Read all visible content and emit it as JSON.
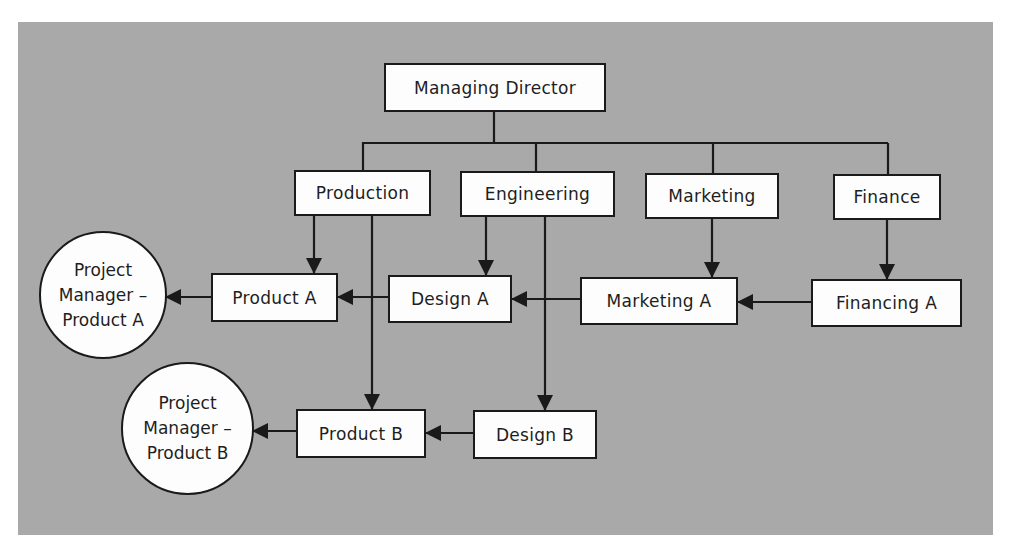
{
  "diagram": {
    "type": "matrix organization chart",
    "background_color": "#a9a9a9",
    "box_color": "#fdfdfd",
    "line_color": "#1a1a1a",
    "top": {
      "id": "md",
      "label": "Managing Director"
    },
    "departments": [
      {
        "id": "production",
        "label": "Production"
      },
      {
        "id": "engineering",
        "label": "Engineering"
      },
      {
        "id": "marketing",
        "label": "Marketing"
      },
      {
        "id": "finance",
        "label": "Finance"
      }
    ],
    "project_a_units": [
      {
        "id": "product_a",
        "label": "Product A"
      },
      {
        "id": "design_a",
        "label": "Design A"
      },
      {
        "id": "marketing_a",
        "label": "Marketing A"
      },
      {
        "id": "financing_a",
        "label": "Financing A"
      }
    ],
    "project_b_units": [
      {
        "id": "product_b",
        "label": "Product B"
      },
      {
        "id": "design_b",
        "label": "Design B"
      }
    ],
    "project_managers": [
      {
        "id": "pm_a",
        "lines": [
          "Project",
          "Manager –",
          "Product A"
        ]
      },
      {
        "id": "pm_b",
        "lines": [
          "Project",
          "Manager –",
          "Product B"
        ]
      }
    ],
    "edges": [
      {
        "from": "md",
        "to": "production",
        "arrow": false
      },
      {
        "from": "md",
        "to": "engineering",
        "arrow": false
      },
      {
        "from": "md",
        "to": "marketing",
        "arrow": false
      },
      {
        "from": "md",
        "to": "finance",
        "arrow": false
      },
      {
        "from": "production",
        "to": "product_a",
        "arrow": true
      },
      {
        "from": "production",
        "to": "product_b",
        "arrow": true
      },
      {
        "from": "engineering",
        "to": "design_a",
        "arrow": true
      },
      {
        "from": "engineering",
        "to": "design_b",
        "arrow": true
      },
      {
        "from": "marketing",
        "to": "marketing_a",
        "arrow": true
      },
      {
        "from": "finance",
        "to": "financing_a",
        "arrow": true
      },
      {
        "from": "financing_a",
        "to": "marketing_a",
        "arrow": true
      },
      {
        "from": "marketing_a",
        "to": "design_a",
        "arrow": true
      },
      {
        "from": "design_a",
        "to": "product_a",
        "arrow": true
      },
      {
        "from": "product_a",
        "to": "pm_a",
        "arrow": true
      },
      {
        "from": "design_b",
        "to": "product_b",
        "arrow": true
      },
      {
        "from": "product_b",
        "to": "pm_b",
        "arrow": true
      }
    ]
  }
}
